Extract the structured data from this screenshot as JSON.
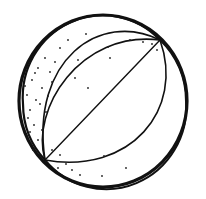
{
  "image": {
    "subject": "beach ball line drawing",
    "width": 206,
    "height": 199,
    "background": "#ffffff",
    "ink_color": "#111111"
  },
  "ball": {
    "center": [
      103,
      101
    ],
    "radius_x": 84,
    "radius_y": 86,
    "inner_rim_offset": 4,
    "pole_top_right": [
      160,
      40
    ],
    "pole_bottom_left": [
      45,
      160
    ],
    "stripes": 4,
    "stippled_panel": "left"
  }
}
